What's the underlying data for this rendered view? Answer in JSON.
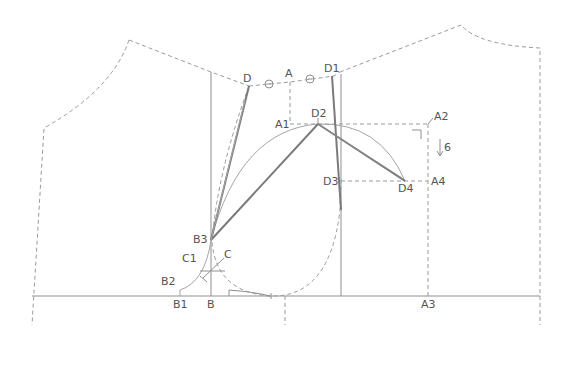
{
  "diagram": {
    "type": "sleeve-armhole pattern drafting diagram",
    "labels": {
      "D": "D",
      "A": "A",
      "D1": "D1",
      "A1": "A1",
      "D2": "D2",
      "A2": "A2",
      "six": "6",
      "D3": "D3",
      "D4": "D4",
      "A4": "A4",
      "B3": "B3",
      "C1": "C1",
      "C": "C",
      "B2": "B2",
      "B1": "B1",
      "B": "B",
      "A3": "A3"
    },
    "annotations": {
      "equal_marks": [
        "circle-mark-left",
        "circle-mark-right"
      ],
      "arrow_down_value": "6"
    },
    "colors": {
      "line": "#8f8f8f",
      "dashed": "#9a9a9a",
      "text": "#555555",
      "background": "#ffffff"
    }
  }
}
